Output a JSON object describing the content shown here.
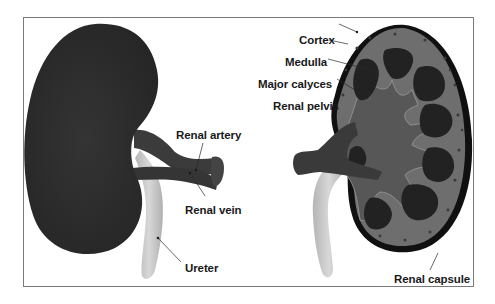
{
  "diagram": {
    "type": "anatomical-illustration",
    "colors": {
      "kidney_exterior": "#2e2e2e",
      "vessels": "#3a3a3a",
      "ureter": "#c8c8c8",
      "cortex": "#6e6e6e",
      "medulla_pyramids": "#232323",
      "calyces_pelvis": "#555555",
      "capsule": "#0f0f0f",
      "frame_border": "#7a7a7a",
      "label_text": "#1a1a1a"
    },
    "left_figure": {
      "name": "External kidney",
      "labels": [
        {
          "id": "renal-artery",
          "text": "Renal artery"
        },
        {
          "id": "renal-vein",
          "text": "Renal vein"
        },
        {
          "id": "ureter",
          "text": "Ureter"
        }
      ]
    },
    "right_figure": {
      "name": "Kidney cross-section",
      "labels": [
        {
          "id": "cortex",
          "text": "Cortex"
        },
        {
          "id": "medulla",
          "text": "Medulla"
        },
        {
          "id": "major-calyces",
          "text": "Major calyces"
        },
        {
          "id": "renal-pelvis",
          "text": "Renal pelvis"
        },
        {
          "id": "renal-capsule",
          "text": "Renal capsule"
        }
      ]
    }
  }
}
